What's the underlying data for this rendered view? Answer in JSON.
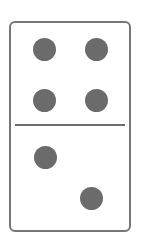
{
  "domino": {
    "top_half": {
      "value": 4
    },
    "bottom_half": {
      "value": 2
    },
    "colors": {
      "border": "#767676",
      "pip": "#6b6b6b",
      "background": "#ffffff"
    }
  }
}
